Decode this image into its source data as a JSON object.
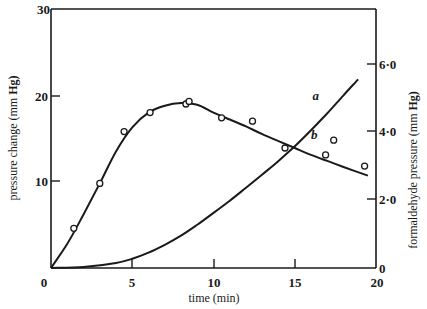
{
  "chart_data": {
    "type": "line",
    "title": "",
    "xlabel": "time (min)",
    "ylabel": "pressure change (mm Hg)",
    "ylabel_right": "formaldehyde pressure (mm Hg)",
    "xlim": [
      0,
      20
    ],
    "ylim": [
      0,
      30
    ],
    "ylim_right": [
      0,
      8.0
    ],
    "x_ticks": [
      "0",
      "5",
      "10",
      "15",
      "20"
    ],
    "y_ticks": [
      "0",
      "10",
      "20",
      "30"
    ],
    "y_ticks_right": [
      "0",
      "2·0",
      "4·0",
      "6·0"
    ],
    "grid": false,
    "legend": "none (curves labelled inline)",
    "series": [
      {
        "name": "b",
        "axis": "left",
        "description": "pressure change (mm Hg)",
        "points": [
          {
            "t": 1.4,
            "p": 4.6
          },
          {
            "t": 3.0,
            "p": 9.8
          },
          {
            "t": 4.5,
            "p": 15.8
          },
          {
            "t": 6.1,
            "p": 18.0
          },
          {
            "t": 8.3,
            "p": 19.0
          },
          {
            "t": 8.5,
            "p": 19.3
          },
          {
            "t": 10.5,
            "p": 17.4
          },
          {
            "t": 12.4,
            "p": 17.0
          },
          {
            "t": 14.4,
            "p": 13.9
          },
          {
            "t": 16.9,
            "p": 13.1
          },
          {
            "t": 17.4,
            "p": 14.8
          },
          {
            "t": 19.3,
            "p": 11.8
          }
        ],
        "curve": [
          [
            0,
            0
          ],
          [
            1,
            2.8
          ],
          [
            2,
            6.2
          ],
          [
            3,
            9.8
          ],
          [
            4,
            13.5
          ],
          [
            5,
            16.3
          ],
          [
            6,
            18.0
          ],
          [
            7,
            18.8
          ],
          [
            8,
            19.1
          ],
          [
            9,
            18.9
          ],
          [
            10,
            18.0
          ],
          [
            11,
            17.2
          ],
          [
            12,
            16.4
          ],
          [
            13,
            15.5
          ],
          [
            14,
            14.7
          ],
          [
            15,
            13.9
          ],
          [
            16,
            13.1
          ],
          [
            17,
            12.4
          ],
          [
            18,
            11.7
          ],
          [
            19.5,
            10.7
          ]
        ]
      },
      {
        "name": "a",
        "axis": "right",
        "description": "formaldehyde pressure (mm Hg)",
        "curve": [
          [
            0,
            0
          ],
          [
            2,
            0.03
          ],
          [
            4,
            0.15
          ],
          [
            5,
            0.27
          ],
          [
            6,
            0.45
          ],
          [
            7,
            0.68
          ],
          [
            8,
            0.95
          ],
          [
            9,
            1.27
          ],
          [
            10,
            1.62
          ],
          [
            11,
            1.98
          ],
          [
            12,
            2.36
          ],
          [
            13,
            2.75
          ],
          [
            14,
            3.15
          ],
          [
            15,
            3.58
          ],
          [
            16,
            4.05
          ],
          [
            17,
            4.55
          ],
          [
            18,
            5.08
          ],
          [
            18.9,
            5.55
          ]
        ]
      }
    ],
    "annotations": [
      {
        "text": "a",
        "t": 16.1,
        "p_right": 4.95
      },
      {
        "text": "b",
        "t": 16.0,
        "p": 15.0
      }
    ]
  },
  "labels": {
    "x_axis": "time (min)",
    "y_left_main": "pressure change (mm ",
    "y_left_bold": "Hg)",
    "y_right_main": "formaldehyde pressure (mm ",
    "y_right_bold": "Hg)",
    "curve_a": "a",
    "curve_b": "b"
  },
  "ticks": {
    "x": [
      "0",
      "5",
      "10",
      "15",
      "20"
    ],
    "y_left": [
      "0",
      "10",
      "20",
      "30"
    ],
    "y_right": [
      "0",
      "2·0",
      "4·0",
      "6·0"
    ]
  },
  "colors": {
    "ink": "#1a1a1a",
    "background": "#ffffff"
  }
}
